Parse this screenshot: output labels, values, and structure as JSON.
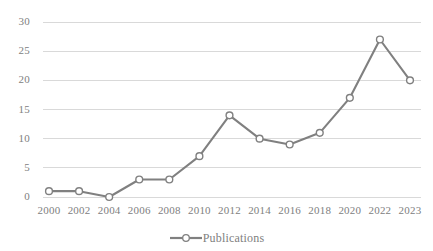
{
  "chart_data": {
    "type": "line",
    "title": "",
    "xlabel": "",
    "ylabel": "",
    "categories": [
      "2000",
      "2002",
      "2004",
      "2006",
      "2008",
      "2010",
      "2012",
      "2014",
      "2016",
      "2018",
      "2020",
      "2022",
      "2023"
    ],
    "series": [
      {
        "name": "Publications",
        "values": [
          1,
          1,
          0,
          3,
          3,
          7,
          14,
          10,
          9,
          11,
          17,
          27,
          20
        ],
        "color": "#808080",
        "marker": "open-circle"
      }
    ],
    "ylim": [
      0,
      30
    ],
    "ytick_labels": [
      "0",
      "5",
      "10",
      "15",
      "20",
      "25",
      "30"
    ],
    "ytick_values": [
      0,
      5,
      10,
      15,
      20,
      25,
      30
    ],
    "grid": true,
    "grid_color": "#d9d9d9",
    "legend_position": "bottom",
    "legend_entries": [
      "Publications"
    ],
    "background_color": "#ffffff",
    "text_color": "#808080"
  }
}
